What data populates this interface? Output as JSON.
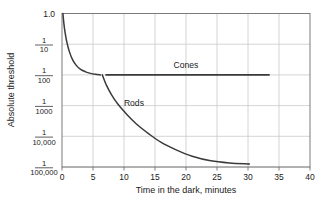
{
  "chart_data": {
    "type": "line",
    "title": "",
    "subtitle": "",
    "xlabel": "Time in the dark, minutes",
    "ylabel": "Absolute threshold",
    "xlim": [
      0,
      40
    ],
    "xticks": [
      0,
      5,
      10,
      15,
      20,
      25,
      30,
      35,
      40
    ],
    "xticklabels": [
      "0",
      "5",
      "10",
      "15",
      "20",
      "25",
      "30",
      "35",
      "40"
    ],
    "ylim_log_decades": [
      0,
      -5
    ],
    "yticklabels": [
      "1.0",
      "1/10",
      "1/100",
      "1/1000",
      "1/10,000",
      "1/100,000"
    ],
    "ytick_fractions": [
      {
        "whole": "1.0",
        "numerator": "",
        "denominator": ""
      },
      {
        "whole": "",
        "numerator": "1",
        "denominator": "10"
      },
      {
        "whole": "",
        "numerator": "1",
        "denominator": "100"
      },
      {
        "whole": "",
        "numerator": "1",
        "denominator": "1000"
      },
      {
        "whole": "",
        "numerator": "1",
        "denominator": "10,000"
      },
      {
        "whole": "",
        "numerator": "1",
        "denominator": "100,000"
      }
    ],
    "grid": true,
    "grid_color": "#c9c9c9",
    "frame_color": "#6d6d6d",
    "line_color": "#3a3a3a",
    "legend_position": "inline-annotations",
    "series": [
      {
        "name": "Cones",
        "annotation": "Cones",
        "annotation_x": 20.0,
        "annotation_y_decade": -1.78,
        "points": [
          {
            "x": 0.15,
            "y_decade": 0.0
          },
          {
            "x": 0.3,
            "y_decade": -0.32
          },
          {
            "x": 0.5,
            "y_decade": -0.62
          },
          {
            "x": 0.8,
            "y_decade": -0.95
          },
          {
            "x": 1.2,
            "y_decade": -1.25
          },
          {
            "x": 1.7,
            "y_decade": -1.5
          },
          {
            "x": 2.3,
            "y_decade": -1.69
          },
          {
            "x": 3.0,
            "y_decade": -1.82
          },
          {
            "x": 3.8,
            "y_decade": -1.9
          },
          {
            "x": 4.6,
            "y_decade": -1.95
          },
          {
            "x": 5.4,
            "y_decade": -1.98
          },
          {
            "x": 6.2,
            "y_decade": -2.0
          }
        ],
        "plateau": {
          "x_start": 7.0,
          "x_end": 33.5,
          "y_decade": -2.0
        }
      },
      {
        "name": "Rods",
        "annotation": "Rods",
        "annotation_x": 11.6,
        "annotation_y_decade": -3.02,
        "points": [
          {
            "x": 6.5,
            "y_decade": -2.0
          },
          {
            "x": 7.2,
            "y_decade": -2.35
          },
          {
            "x": 8.0,
            "y_decade": -2.65
          },
          {
            "x": 9.0,
            "y_decade": -2.95
          },
          {
            "x": 10.5,
            "y_decade": -3.3
          },
          {
            "x": 12.0,
            "y_decade": -3.6
          },
          {
            "x": 14.0,
            "y_decade": -3.92
          },
          {
            "x": 16.0,
            "y_decade": -4.2
          },
          {
            "x": 18.5,
            "y_decade": -4.45
          },
          {
            "x": 21.0,
            "y_decade": -4.65
          },
          {
            "x": 24.0,
            "y_decade": -4.8
          },
          {
            "x": 27.0,
            "y_decade": -4.87
          },
          {
            "x": 30.0,
            "y_decade": -4.9
          }
        ],
        "plateau": {
          "x_start": 30.0,
          "x_end": 30.3,
          "y_decade": -4.9
        }
      }
    ],
    "annotations": [
      {
        "text": "Cones",
        "x": 20.0,
        "y_decade": -1.78
      },
      {
        "text": "Rods",
        "x": 11.6,
        "y_decade": -3.02
      }
    ]
  }
}
